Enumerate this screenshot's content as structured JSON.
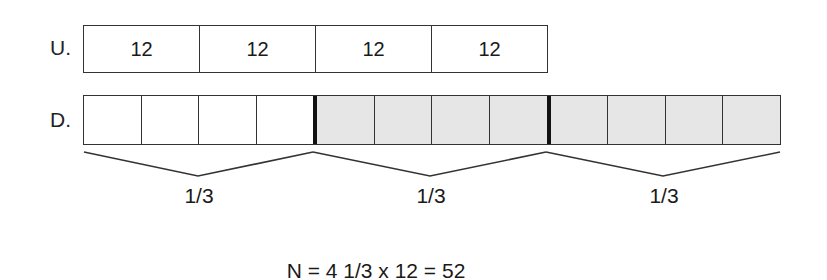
{
  "rows": {
    "u": {
      "label": "U.",
      "cells": [
        "12",
        "12",
        "12",
        "12"
      ]
    },
    "d": {
      "label": "D.",
      "cells": [
        {
          "shaded": false,
          "thick_right": false
        },
        {
          "shaded": false,
          "thick_right": false
        },
        {
          "shaded": false,
          "thick_right": false
        },
        {
          "shaded": false,
          "thick_right": true
        },
        {
          "shaded": true,
          "thick_right": false
        },
        {
          "shaded": true,
          "thick_right": false
        },
        {
          "shaded": true,
          "thick_right": false
        },
        {
          "shaded": true,
          "thick_right": true
        },
        {
          "shaded": true,
          "thick_right": false
        },
        {
          "shaded": true,
          "thick_right": false
        },
        {
          "shaded": true,
          "thick_right": false
        },
        {
          "shaded": true,
          "thick_right": false
        }
      ]
    }
  },
  "braces": [
    {
      "label": "1/3"
    },
    {
      "label": "1/3"
    },
    {
      "label": "1/3"
    }
  ],
  "equation": "N = 4 1/3 x 12 = 52",
  "colors": {
    "line": "#333333",
    "shade": "#e6e6e6",
    "divider": "#111111"
  }
}
